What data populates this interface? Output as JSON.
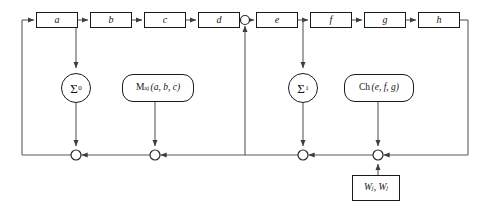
{
  "diagram": {
    "state_registers": [
      {
        "id": "a",
        "label": "a",
        "x": 36,
        "y": 12,
        "w": 42,
        "h": 16
      },
      {
        "id": "b",
        "label": "b",
        "x": 90,
        "y": 12,
        "w": 42,
        "h": 16
      },
      {
        "id": "c",
        "label": "c",
        "x": 144,
        "y": 12,
        "w": 42,
        "h": 16
      },
      {
        "id": "d",
        "label": "d",
        "x": 198,
        "y": 12,
        "w": 42,
        "h": 16
      },
      {
        "id": "e",
        "label": "e",
        "x": 256,
        "y": 12,
        "w": 42,
        "h": 16
      },
      {
        "id": "f",
        "label": "f",
        "x": 310,
        "y": 12,
        "w": 42,
        "h": 16
      },
      {
        "id": "g",
        "label": "g",
        "x": 364,
        "y": 12,
        "w": 42,
        "h": 16
      },
      {
        "id": "h",
        "label": "h",
        "x": 418,
        "y": 12,
        "w": 42,
        "h": 16
      }
    ],
    "adders": [
      {
        "id": "sigma0",
        "symbol": "Σ",
        "subscript": "0",
        "cx": 76,
        "cy": 88,
        "r": 15
      },
      {
        "id": "sigma1",
        "symbol": "Σ",
        "subscript": "1",
        "cx": 303,
        "cy": 88,
        "r": 15
      }
    ],
    "functions": [
      {
        "id": "maj",
        "name": "M",
        "subscript": "aj",
        "args": "(a, b, c)",
        "x": 122,
        "y": 74,
        "w": 72,
        "h": 28
      },
      {
        "id": "ch",
        "name": "Ch",
        "subscript": "",
        "args": "(e, f, g)",
        "x": 344,
        "y": 74,
        "w": 70,
        "h": 28
      }
    ],
    "constants": [
      {
        "id": "wk",
        "label": "W",
        "sub1": "j",
        "label2": "W",
        "sub2": "j",
        "text": "Wⱼ, Wⱼ",
        "x": 352,
        "y": 175,
        "w": 48,
        "h": 26
      }
    ],
    "junctions": [
      {
        "id": "top-split-d-e",
        "cx": 245,
        "cy": 20,
        "r": 4.5
      },
      {
        "id": "bus-sigma0",
        "cx": 76,
        "cy": 155,
        "r": 5
      },
      {
        "id": "bus-maj",
        "cx": 155,
        "cy": 155,
        "r": 5
      },
      {
        "id": "bus-sigma1",
        "cx": 303,
        "cy": 155,
        "r": 5
      },
      {
        "id": "bus-ch-wk",
        "cx": 378,
        "cy": 155,
        "r": 5
      }
    ],
    "colors": {
      "line": "#4a4a4a",
      "box_border": "#1a1a1a",
      "text": "#141414",
      "background": "#ffffff"
    },
    "bus_line": {
      "y": 155,
      "x_left": 22,
      "x_right": 468
    },
    "feedback": {
      "left_x": 22,
      "right_x": 468,
      "top_y": 20
    }
  }
}
